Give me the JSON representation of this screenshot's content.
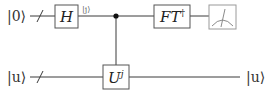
{
  "diagram": {
    "type": "quantum-circuit",
    "title": "",
    "wires": [
      {
        "id": "register-top",
        "input_label": "|0⟩",
        "multi_qubit": true,
        "gates": [
          "H",
          "control",
          "FT†",
          "measure"
        ],
        "output_label": ""
      },
      {
        "id": "register-bottom",
        "input_label": "|u⟩",
        "multi_qubit": true,
        "gates": [
          "U^j"
        ],
        "output_label": "|u⟩"
      }
    ],
    "labels": {
      "top_input": "|0⟩",
      "bottom_input": "|u⟩",
      "bottom_output": "|u⟩",
      "intermediate_state": "|j⟩"
    },
    "gates": {
      "hadamard": {
        "label": "H"
      },
      "controlled_unitary": {
        "base": "U",
        "exponent": "j"
      },
      "inverse_ft": {
        "base": "FT",
        "exponent": "†"
      },
      "measurement": {
        "label": "meter"
      }
    },
    "colors": {
      "wire": "#3a3a3a",
      "gate_border": "#555555",
      "meter_border": "#9a9a9a",
      "control_dot": "#111111",
      "background": "#ffffff"
    }
  }
}
